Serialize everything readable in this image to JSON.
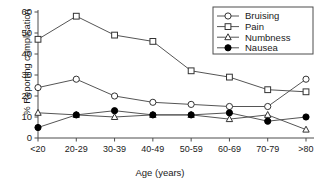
{
  "chart_data": {
    "type": "line",
    "title": "",
    "xlabel": "Age (years)",
    "ylabel": "% Reporting complication",
    "categories": [
      "<20",
      "20-29",
      "30-39",
      "40-49",
      "50-59",
      "60-69",
      "70-79",
      ">80"
    ],
    "ylim": [
      0,
      60
    ],
    "yticks": [
      0,
      10,
      20,
      30,
      40,
      50,
      60
    ],
    "grid": false,
    "legend_position": "top-right",
    "series": [
      {
        "name": "Bruising",
        "marker": "open-circle",
        "values": [
          24,
          28,
          20,
          17,
          16,
          15,
          15,
          28
        ]
      },
      {
        "name": "Pain",
        "marker": "open-square",
        "values": [
          47,
          58,
          49,
          46,
          32,
          29,
          23,
          22
        ]
      },
      {
        "name": "Numbness",
        "marker": "open-triangle",
        "values": [
          12,
          11,
          10,
          11,
          11,
          9,
          11,
          4
        ]
      },
      {
        "name": "Nausea",
        "marker": "filled-circle",
        "values": [
          5,
          11,
          13,
          11,
          11,
          12,
          8,
          10
        ]
      }
    ]
  },
  "legend": {
    "items": [
      {
        "label": "Bruising"
      },
      {
        "label": "Pain"
      },
      {
        "label": "Numbness"
      },
      {
        "label": "Nausea"
      }
    ]
  },
  "axes": {
    "y_tick_labels": [
      "0",
      "10",
      "20",
      "30",
      "40",
      "50",
      "60"
    ],
    "x_tick_labels": [
      "<20",
      "20-29",
      "30-39",
      "40-49",
      "50-59",
      "60-69",
      "70-79",
      ">80"
    ],
    "x_title": "Age (years)",
    "y_title": "% Reporting complication"
  },
  "colors": {
    "line": "#555555",
    "axis": "#4d4d4d",
    "marker_fill_open": "#ffffff",
    "marker_fill_solid": "#000000",
    "text": "#1a1a1a",
    "background": "#ffffff"
  }
}
